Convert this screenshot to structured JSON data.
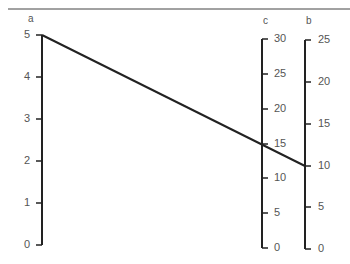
{
  "diagram": {
    "type": "nomogram",
    "axes": [
      {
        "name": "a",
        "ticks": [
          "0",
          "1",
          "2",
          "3",
          "4",
          "5"
        ]
      },
      {
        "name": "c",
        "ticks": [
          "0",
          "5",
          "10",
          "15",
          "20",
          "25",
          "30"
        ]
      },
      {
        "name": "b",
        "ticks": [
          "0",
          "5",
          "10",
          "15",
          "20",
          "25"
        ]
      }
    ],
    "isopleth": {
      "a": 5,
      "b": 10,
      "c": 15
    }
  },
  "labels": {
    "a": "a",
    "c": "c",
    "b": "b",
    "a_ticks": [
      "0",
      "1",
      "2",
      "3",
      "4",
      "5"
    ],
    "c_ticks": [
      "0",
      "5",
      "10",
      "15",
      "20",
      "25",
      "30"
    ],
    "b_ticks": [
      "0",
      "5",
      "10",
      "15",
      "20",
      "25"
    ]
  }
}
